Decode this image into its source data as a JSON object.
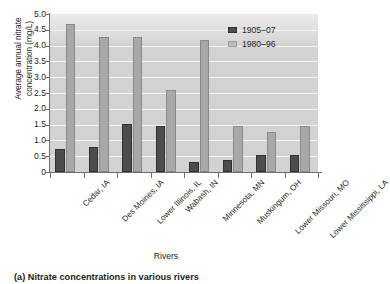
{
  "chart_data": {
    "type": "bar",
    "title": "",
    "xlabel": "Rivers",
    "ylabel": "Average annual nitrate\nconcentration (mg/L)",
    "ylim": [
      0,
      5.0
    ],
    "ytick_labels": [
      "5.0",
      "4.5",
      "4.0",
      "3.5",
      "3.0",
      "2.5",
      "2.0",
      "1.5",
      "1.0",
      "0.5",
      "0"
    ],
    "ytick_values": [
      5.0,
      4.5,
      4.0,
      3.5,
      3.0,
      2.5,
      2.0,
      1.5,
      1.0,
      0.5,
      0
    ],
    "grid": "horizontal",
    "legend_position": "top-right",
    "categories": [
      "Cedar, IA",
      "Des Moines, IA",
      "Lower Illinois, IL",
      "Wabash, IN",
      "Minnesota, MN",
      "Muskingum, OH",
      "Lower Missouri, MO",
      "Lower Mississippi, LA"
    ],
    "series": [
      {
        "name": "1905–07",
        "color": "#4d4d4f",
        "values": [
          0.73,
          0.79,
          1.51,
          1.45,
          0.32,
          0.37,
          0.53,
          0.54
        ]
      },
      {
        "name": "1980–96",
        "color": "#a8a8a8",
        "values": [
          4.69,
          4.28,
          4.27,
          2.61,
          4.18,
          1.45,
          1.26,
          1.45
        ]
      }
    ]
  },
  "caption": "(a) Nitrate concentrations in various rivers"
}
